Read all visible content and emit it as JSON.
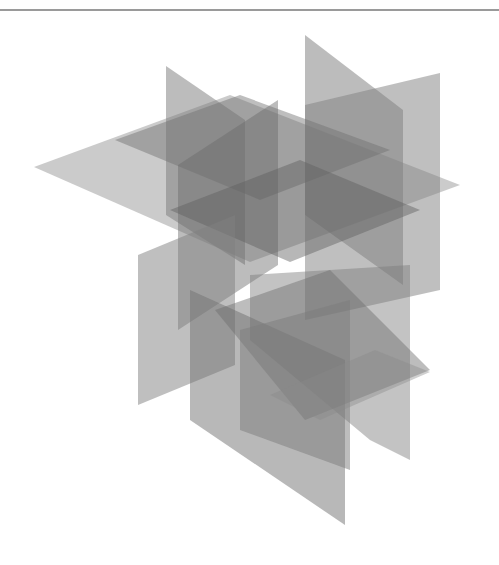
{
  "canvas": {
    "width": 499,
    "height": 565,
    "background": "#ffffff"
  },
  "rule": {
    "color": "#9a9a9a",
    "y": 10
  },
  "planes": [
    {
      "name": "horizontal-plane-large-left",
      "fill": "#8c8c8c",
      "opacity": 0.45,
      "points": "34,167 230,95 460,185 250,262"
    },
    {
      "name": "vertical-plane-left-tall",
      "fill": "#7a7a7a",
      "opacity": 0.5,
      "points": "166,66 245,120 245,265 166,215"
    },
    {
      "name": "vertical-plane-back-right",
      "fill": "#7a7a7a",
      "opacity": 0.5,
      "points": "305,35 403,110 403,285 305,215"
    },
    {
      "name": "vertical-plane-right-edge",
      "fill": "#7f7f7f",
      "opacity": 0.5,
      "points": "305,105 440,73 440,290 305,320"
    },
    {
      "name": "horizontal-plane-upper-mid",
      "fill": "#6f6f6f",
      "opacity": 0.45,
      "points": "115,140 240,95 390,150 260,200"
    },
    {
      "name": "vertical-plane-mid-front",
      "fill": "#6a6a6a",
      "opacity": 0.45,
      "points": "178,165 278,100 278,265 178,330"
    },
    {
      "name": "horizontal-plane-center",
      "fill": "#5f5f5f",
      "opacity": 0.45,
      "points": "170,210 300,160 420,210 290,262"
    },
    {
      "name": "vertical-plane-left-lower",
      "fill": "#808080",
      "opacity": 0.5,
      "points": "138,255 235,215 235,365 138,405"
    },
    {
      "name": "vertical-plane-center-lower",
      "fill": "#727272",
      "opacity": 0.5,
      "points": "190,290 345,360 345,525 190,420"
    },
    {
      "name": "vertical-plane-right-lower",
      "fill": "#7a7a7a",
      "opacity": 0.45,
      "points": "250,275 410,265 410,460 370,440 250,340"
    },
    {
      "name": "horizontal-plane-lower",
      "fill": "#6c6c6c",
      "opacity": 0.45,
      "points": "215,310 330,270 430,370 305,420"
    },
    {
      "name": "vertical-plane-bottom-front",
      "fill": "#7c7c7c",
      "opacity": 0.5,
      "points": "240,330 350,300 350,470 240,430"
    },
    {
      "name": "horizontal-plane-bottom-right",
      "fill": "#8a8a8a",
      "opacity": 0.4,
      "points": "270,395 375,350 430,372 320,420"
    }
  ]
}
